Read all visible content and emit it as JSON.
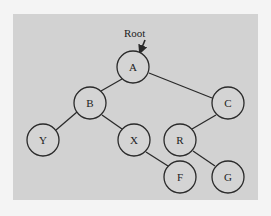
{
  "diagram": {
    "type": "binary-tree",
    "root_label": "Root",
    "colors": {
      "background": "#d2d2d2",
      "stroke": "#2a2a2a",
      "page": "#f4f4f4"
    },
    "nodes": [
      {
        "id": "A",
        "label": "A",
        "x": 133,
        "y": 67
      },
      {
        "id": "B",
        "label": "B",
        "x": 90,
        "y": 103
      },
      {
        "id": "C",
        "label": "C",
        "x": 228,
        "y": 103
      },
      {
        "id": "Y",
        "label": "Y",
        "x": 43,
        "y": 140
      },
      {
        "id": "X",
        "label": "X",
        "x": 134,
        "y": 140
      },
      {
        "id": "R",
        "label": "R",
        "x": 180,
        "y": 140
      },
      {
        "id": "F",
        "label": "F",
        "x": 180,
        "y": 177
      },
      {
        "id": "G",
        "label": "G",
        "x": 228,
        "y": 177
      }
    ],
    "edges": [
      {
        "from": "A",
        "to": "B"
      },
      {
        "from": "A",
        "to": "C"
      },
      {
        "from": "B",
        "to": "Y"
      },
      {
        "from": "B",
        "to": "X"
      },
      {
        "from": "X",
        "to": "F"
      },
      {
        "from": "C",
        "to": "R"
      },
      {
        "from": "R",
        "to": "G"
      }
    ]
  }
}
